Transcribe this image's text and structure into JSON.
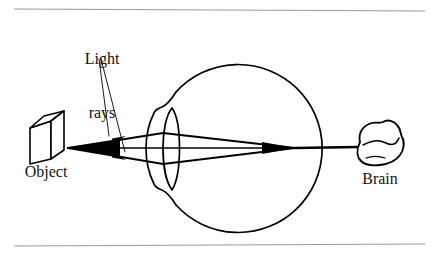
{
  "figure": {
    "background_color": "#ffffff",
    "ink_color": "#000000",
    "rule_color": "#9a9a9a",
    "labels": {
      "light_rays_line1": "Light",
      "light_rays_line2": "rays",
      "object": "Object",
      "brain": "Brain"
    },
    "parts": [
      {
        "name": "object-box",
        "description": "three-dimensional rectangular block at far left"
      },
      {
        "name": "light-rays",
        "description": "two converging rays with arrowheads plus central axis ray"
      },
      {
        "name": "eyeball",
        "description": "large circle representing the eye"
      },
      {
        "name": "cornea",
        "description": "bulge on the left side of the eyeball"
      },
      {
        "name": "lens",
        "description": "pointed almond shape inside the eye"
      },
      {
        "name": "retina-focus-point",
        "description": "point where rays converge at the back of the eye"
      },
      {
        "name": "optic-nerve",
        "description": "straight line from eye to brain"
      },
      {
        "name": "brain",
        "description": "irregular blob with a fold line"
      }
    ],
    "rules": {
      "top_y": 9,
      "bottom_y": 245,
      "x_start": 14,
      "x_end": 425
    }
  }
}
